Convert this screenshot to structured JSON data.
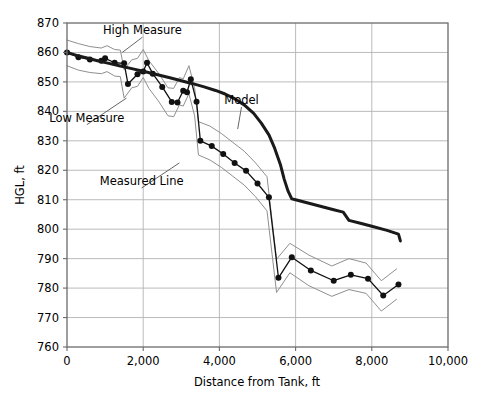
{
  "chart_data": {
    "type": "line",
    "title": "",
    "xlabel": "Distance from Tank, ft",
    "ylabel": "HGL, ft",
    "xlim": [
      0,
      10000
    ],
    "ylim": [
      760,
      870
    ],
    "xticks": [
      0,
      2000,
      4000,
      6000,
      8000,
      10000
    ],
    "xtick_labels": [
      "0",
      "2,000",
      "4,000",
      "6,000",
      "8,000",
      "10,000"
    ],
    "yticks": [
      760,
      770,
      780,
      790,
      800,
      810,
      820,
      830,
      840,
      850,
      860,
      870
    ],
    "ytick_labels": [
      "760",
      "770",
      "780",
      "790",
      "800",
      "810",
      "820",
      "830",
      "840",
      "850",
      "860",
      "870"
    ],
    "grid": true,
    "grid_color": "#b3b3b3",
    "legend": "none",
    "annotations": [
      {
        "label": "High Measure",
        "x": 1980,
        "y": 866.2,
        "leader_to_x": 1450,
        "leader_to_y": 860.0
      },
      {
        "label": "Low Measure",
        "x": 520,
        "y": 836.5,
        "leader_to_x": 1560,
        "leader_to_y": 844.5
      },
      {
        "label": "Measured Line",
        "x": 1960,
        "y": 815.0,
        "leader_to_x": 2950,
        "leader_to_y": 822.5
      },
      {
        "label": "Model",
        "x": 4580,
        "y": 842.5,
        "leader_to_x": 4480,
        "leader_to_y": 834.0
      }
    ],
    "series": [
      {
        "name": "Model",
        "style": "thick-solid-black",
        "color": "#1a1a1a",
        "width": 3.0,
        "markers": false,
        "points": [
          [
            0,
            860.0
          ],
          [
            250,
            859.0
          ],
          [
            500,
            858.2
          ],
          [
            800,
            857.2
          ],
          [
            1100,
            856.3
          ],
          [
            1400,
            855.4
          ],
          [
            1700,
            854.5
          ],
          [
            2000,
            853.6
          ],
          [
            2350,
            852.5
          ],
          [
            2700,
            851.4
          ],
          [
            3000,
            850.4
          ],
          [
            3300,
            849.4
          ],
          [
            3600,
            848.3
          ],
          [
            3900,
            847.1
          ],
          [
            4150,
            845.9
          ],
          [
            4400,
            844.3
          ],
          [
            4650,
            842.2
          ],
          [
            4900,
            839.3
          ],
          [
            5100,
            836.0
          ],
          [
            5300,
            832.0
          ],
          [
            5450,
            827.5
          ],
          [
            5600,
            822.0
          ],
          [
            5700,
            817.0
          ],
          [
            5800,
            813.0
          ],
          [
            5900,
            810.3
          ],
          [
            6000,
            810.0
          ],
          [
            6500,
            808.3
          ],
          [
            7000,
            806.6
          ],
          [
            7250,
            805.8
          ],
          [
            7400,
            803.0
          ],
          [
            7700,
            802.0
          ],
          [
            8000,
            801.0
          ],
          [
            8400,
            799.6
          ],
          [
            8700,
            798.3
          ],
          [
            8750,
            796.0
          ]
        ]
      },
      {
        "name": "Measured Line",
        "style": "thin-solid-black-with-dots",
        "color": "#111111",
        "width": 1.3,
        "markers": true,
        "marker_size": 3.0,
        "points": [
          [
            0,
            860.0
          ],
          [
            300,
            858.4
          ],
          [
            600,
            857.6
          ],
          [
            900,
            857.2
          ],
          [
            1000,
            858.0
          ],
          [
            1250,
            856.5
          ],
          [
            1500,
            856.3
          ],
          [
            1600,
            849.3
          ],
          [
            1850,
            852.6
          ],
          [
            2000,
            853.5
          ],
          [
            2100,
            856.5
          ],
          [
            2250,
            852.8
          ],
          [
            2500,
            848.3
          ],
          [
            2750,
            843.2
          ],
          [
            2900,
            843.0
          ],
          [
            3050,
            847.0
          ],
          [
            3150,
            846.5
          ],
          [
            3250,
            850.9
          ],
          [
            3400,
            843.3
          ],
          [
            3500,
            830.0
          ],
          [
            3800,
            828.2
          ],
          [
            4100,
            825.5
          ],
          [
            4400,
            822.5
          ],
          [
            4700,
            819.8
          ],
          [
            5000,
            815.5
          ],
          [
            5300,
            810.8
          ],
          [
            5550,
            783.5
          ],
          [
            5900,
            790.5
          ],
          [
            6400,
            786.0
          ],
          [
            7000,
            782.5
          ],
          [
            7450,
            784.5
          ],
          [
            7900,
            783.2
          ],
          [
            8300,
            777.5
          ],
          [
            8700,
            781.2
          ]
        ]
      },
      {
        "name": "High Measure",
        "style": "thin-solid-gray",
        "color": "#8f8f8f",
        "width": 1.0,
        "markers": false,
        "points": [
          [
            0,
            864.2
          ],
          [
            300,
            863.0
          ],
          [
            600,
            862.0
          ],
          [
            900,
            861.5
          ],
          [
            1050,
            862.3
          ],
          [
            1250,
            861.0
          ],
          [
            1400,
            860.8
          ],
          [
            1500,
            854.2
          ],
          [
            1700,
            857.5
          ],
          [
            1850,
            858.0
          ],
          [
            2000,
            861.0
          ],
          [
            2150,
            857.2
          ],
          [
            2400,
            853.0
          ],
          [
            2650,
            848.0
          ],
          [
            2800,
            847.8
          ],
          [
            2950,
            851.5
          ],
          [
            3050,
            851.0
          ],
          [
            3200,
            855.5
          ],
          [
            3350,
            848.0
          ],
          [
            3450,
            836.5
          ],
          [
            3750,
            835.0
          ],
          [
            4050,
            832.5
          ],
          [
            4350,
            829.5
          ],
          [
            4650,
            826.5
          ],
          [
            4950,
            822.5
          ],
          [
            5250,
            817.8
          ],
          [
            5500,
            789.8
          ],
          [
            5850,
            795.2
          ],
          [
            6350,
            791.2
          ],
          [
            6950,
            787.5
          ],
          [
            7400,
            790.0
          ],
          [
            7850,
            788.5
          ],
          [
            8250,
            782.5
          ],
          [
            8650,
            786.5
          ]
        ]
      },
      {
        "name": "Low Measure",
        "style": "thin-solid-gray",
        "color": "#8f8f8f",
        "width": 1.0,
        "markers": false,
        "points": [
          [
            0,
            855.5
          ],
          [
            300,
            854.0
          ],
          [
            600,
            853.2
          ],
          [
            900,
            852.8
          ],
          [
            1050,
            853.5
          ],
          [
            1250,
            852.0
          ],
          [
            1400,
            851.8
          ],
          [
            1500,
            844.5
          ],
          [
            1700,
            848.0
          ],
          [
            1850,
            848.5
          ],
          [
            2000,
            851.5
          ],
          [
            2150,
            847.8
          ],
          [
            2400,
            843.5
          ],
          [
            2650,
            838.5
          ],
          [
            2800,
            838.2
          ],
          [
            2950,
            842.2
          ],
          [
            3050,
            841.8
          ],
          [
            3200,
            846.0
          ],
          [
            3350,
            838.5
          ],
          [
            3450,
            825.2
          ],
          [
            3750,
            823.5
          ],
          [
            4050,
            821.0
          ],
          [
            4350,
            818.0
          ],
          [
            4650,
            815.0
          ],
          [
            4950,
            811.0
          ],
          [
            5250,
            806.2
          ],
          [
            5500,
            778.5
          ],
          [
            5850,
            785.2
          ],
          [
            6350,
            780.8
          ],
          [
            6950,
            777.2
          ],
          [
            7400,
            779.5
          ],
          [
            7850,
            778.2
          ],
          [
            8250,
            772.2
          ],
          [
            8650,
            776.2
          ]
        ]
      }
    ]
  }
}
